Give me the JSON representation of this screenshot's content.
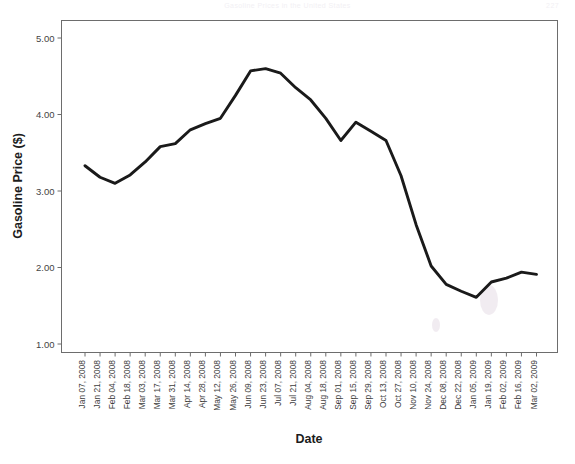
{
  "page": {
    "header_faint_text": "Gasoline Prices in the United States",
    "header_page_number": "227"
  },
  "chart_data": {
    "type": "line",
    "title": "",
    "xlabel": "Date",
    "ylabel": "Gasoline Price ($)",
    "ylim": [
      1.0,
      5.0
    ],
    "yticks": [
      1.0,
      2.0,
      3.0,
      4.0,
      5.0
    ],
    "ytick_labels": [
      "1.00",
      "2.00",
      "3.00",
      "4.00",
      "5.00"
    ],
    "grid": false,
    "legend": "none",
    "line_color": "#1a1a1a",
    "categories": [
      "Jan 07, 2008",
      "Jan 21, 2008",
      "Feb 04, 2008",
      "Feb 18, 2008",
      "Mar 03, 2008",
      "Mar 17, 2008",
      "Mar 31, 2008",
      "Apr 14, 2008",
      "Apr 28, 2008",
      "May 12, 2008",
      "May 26, 2008",
      "Jun 09, 2008",
      "Jun 23, 2008",
      "Jul 07, 2008",
      "Jul 21, 2008",
      "Aug 04, 2008",
      "Aug 18, 2008",
      "Sep 01, 2008",
      "Sep 15, 2008",
      "Sep 29, 2008",
      "Oct 13, 2008",
      "Oct 27, 2008",
      "Nov 10, 2008",
      "Nov 24, 2008",
      "Dec 08, 2008",
      "Dec 22, 2008",
      "Jan 05, 2009",
      "Jan 19, 2009",
      "Feb 02, 2009",
      "Feb 16, 2009",
      "Mar 02, 2009"
    ],
    "values": [
      3.33,
      3.18,
      3.1,
      3.21,
      3.38,
      3.58,
      3.62,
      3.8,
      3.88,
      3.95,
      4.25,
      4.57,
      4.6,
      4.54,
      4.35,
      4.19,
      3.95,
      3.66,
      3.9,
      3.78,
      3.66,
      3.2,
      2.56,
      2.02,
      1.78,
      1.69,
      1.61,
      1.81,
      1.86,
      1.94,
      1.91
    ]
  }
}
